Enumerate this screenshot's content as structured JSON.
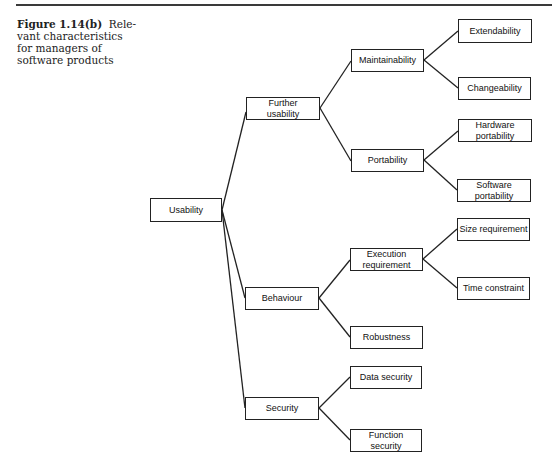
{
  "caption": {
    "label": "Figure 1.14(b)",
    "text": "Relevant characteristics for managers of software products",
    "line1_rest": "Rele-",
    "line2": "vant characteristics",
    "line3": "for managers of",
    "line4": "software products"
  },
  "tree": {
    "root": {
      "id": "usability",
      "label": "Usability",
      "box": [
        150,
        198,
        72,
        24
      ]
    },
    "nodes": [
      {
        "id": "further-usability",
        "label": "Further usability",
        "box": [
          246,
          97,
          74,
          23
        ],
        "parent": "usability"
      },
      {
        "id": "behaviour",
        "label": "Behaviour",
        "box": [
          245,
          287,
          74,
          23
        ],
        "parent": "usability"
      },
      {
        "id": "security",
        "label": "Security",
        "box": [
          245,
          397,
          74,
          23
        ],
        "parent": "usability"
      },
      {
        "id": "maintainability",
        "label": "Maintainability",
        "box": [
          351,
          49,
          73,
          23
        ],
        "parent": "further-usability"
      },
      {
        "id": "portability",
        "label": "Portability",
        "box": [
          351,
          149,
          73,
          23
        ],
        "parent": "further-usability"
      },
      {
        "id": "execution-requirement",
        "label": "Execution requirement",
        "box": [
          350,
          248,
          73,
          23
        ],
        "parent": "behaviour"
      },
      {
        "id": "robustness",
        "label": "Robustness",
        "box": [
          350,
          326,
          73,
          23
        ],
        "parent": "behaviour"
      },
      {
        "id": "data-security",
        "label": "Data security",
        "box": [
          350,
          366,
          72,
          23
        ],
        "parent": "security"
      },
      {
        "id": "function-security",
        "label": "Function security",
        "box": [
          350,
          429,
          72,
          23
        ],
        "parent": "security"
      },
      {
        "id": "extendability",
        "label": "Extendability",
        "box": [
          458,
          19,
          74,
          24
        ],
        "parent": "maintainability"
      },
      {
        "id": "changeability",
        "label": "Changeability",
        "box": [
          458,
          77,
          73,
          23
        ],
        "parent": "maintainability"
      },
      {
        "id": "hardware-portability",
        "label": "Hardware portability",
        "box": [
          458,
          119,
          74,
          23
        ],
        "parent": "portability"
      },
      {
        "id": "software-portability",
        "label": "Software portability",
        "box": [
          457,
          179,
          74,
          23
        ],
        "parent": "portability"
      },
      {
        "id": "size-requirement",
        "label": "Size requirement",
        "box": [
          457,
          218,
          73,
          23
        ],
        "parent": "execution-requirement"
      },
      {
        "id": "time-constraint",
        "label": "Time constraint",
        "box": [
          457,
          277,
          73,
          23
        ],
        "parent": "execution-requirement"
      }
    ]
  }
}
